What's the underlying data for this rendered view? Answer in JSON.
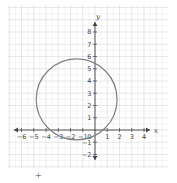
{
  "chart_data": {
    "type": "scatter",
    "title": "",
    "xlabel": "x",
    "ylabel": "y",
    "xlim": [
      -6.5,
      5.6
    ],
    "ylim": [
      -3,
      9.6
    ],
    "grid": true,
    "minor_grid": true,
    "x_ticks": [
      -6,
      -5,
      -4,
      -3,
      -2,
      -1,
      1,
      2,
      3,
      4
    ],
    "y_ticks": [
      -2,
      -1,
      1,
      2,
      3,
      4,
      5,
      6,
      7,
      8
    ],
    "origin_label": "0",
    "shapes": [
      {
        "kind": "circle",
        "center": [
          -1.5,
          2.5
        ],
        "radius": 3.3,
        "color": "#808080"
      }
    ]
  },
  "colors": {
    "grid_major": "#d9d9d9",
    "grid_minor": "#efefef",
    "axis": "#444444",
    "curve": "#808080"
  },
  "annotations": {
    "cursor_mark": "+"
  }
}
